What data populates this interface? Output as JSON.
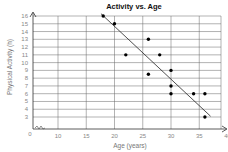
{
  "chart_data": {
    "type": "scatter",
    "title": "Activity vs. Age",
    "xlabel": "Age (years)",
    "ylabel": "Physical Activity (h)",
    "xlim": [
      0,
      40
    ],
    "ylim": [
      0,
      16
    ],
    "x_ticks": [
      0,
      10,
      15,
      20,
      25,
      30,
      35,
      40
    ],
    "y_ticks": [
      0,
      3,
      4,
      5,
      6,
      7,
      8,
      9,
      10,
      11,
      12,
      13,
      14,
      15,
      16
    ],
    "axis_break": true,
    "grid": true,
    "legend": null,
    "points": [
      {
        "x": 18,
        "y": 16
      },
      {
        "x": 20,
        "y": 15
      },
      {
        "x": 22,
        "y": 11
      },
      {
        "x": 26,
        "y": 13
      },
      {
        "x": 26,
        "y": 8.5
      },
      {
        "x": 28,
        "y": 11
      },
      {
        "x": 30,
        "y": 9
      },
      {
        "x": 30,
        "y": 7
      },
      {
        "x": 30,
        "y": 6
      },
      {
        "x": 34,
        "y": 6
      },
      {
        "x": 36,
        "y": 6
      },
      {
        "x": 36,
        "y": 3
      }
    ],
    "trend_line": {
      "x1": 17.6,
      "y1": 16.3,
      "x2": 37,
      "y2": 3.1
    },
    "colors": {
      "points": "#000000",
      "line": "#222222",
      "grid": "#555555",
      "ticks": "#888888"
    }
  }
}
